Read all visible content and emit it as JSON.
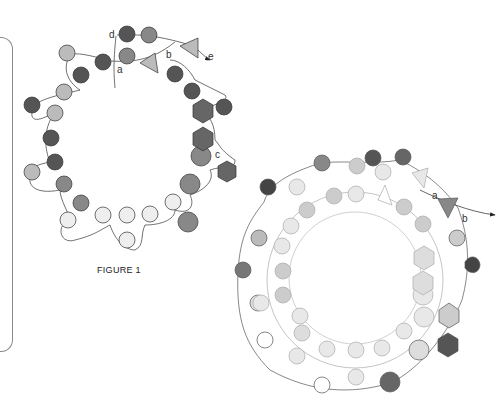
{
  "figure1": {
    "caption": "FIGURE 1",
    "labels": {
      "a": "a",
      "b": "b",
      "c": "c",
      "d": "d",
      "e": "e"
    }
  },
  "figure2": {
    "labels": {
      "a": "a",
      "b": "b"
    }
  },
  "colors": {
    "dark": "#4a4a4a",
    "medium": "#7d7d7d",
    "light": "#b5b5b5",
    "pale": "#e8e8e8",
    "thread": "#444444",
    "frame": "#8a8a8a"
  }
}
